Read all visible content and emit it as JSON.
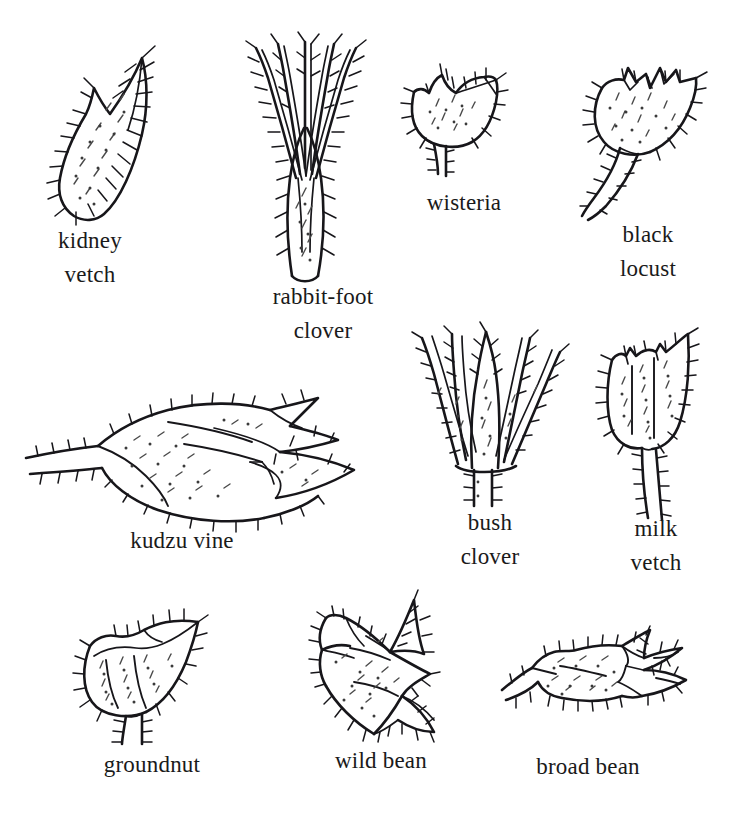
{
  "figure": {
    "background_color": "#ffffff",
    "ink_color": "#17161a",
    "caption_color": "#1a1a1a",
    "style": "pen-and-ink botanical line drawings, hairy calyx outlines with stipple shading"
  },
  "specimens": [
    {
      "id": "kidney-vetch",
      "label": "kidney\nvetch",
      "row": 1,
      "column": 1,
      "drawing": "narrow-pointed-hairy-calyx-with-side-notch"
    },
    {
      "id": "rabbit-foot-clover",
      "label": "rabbit-foot\nclover",
      "row": 1,
      "column": 2,
      "drawing": "tall-tube-with-five-long-slender-hairy-teeth"
    },
    {
      "id": "wisteria",
      "label": "wisteria",
      "row": 1,
      "column": 3,
      "drawing": "small-cup-calyx-with-short-teeth-and-stalk"
    },
    {
      "id": "black-locust",
      "label": "black\nlocust",
      "row": 1,
      "column": 4,
      "drawing": "rounded-cup-with-sawtooth-rim-and-thick-hairy-stalk"
    },
    {
      "id": "kudzu-vine",
      "label": "kudzu vine",
      "row": 2,
      "column": 1,
      "drawing": "sideways-calyx-with-long-pointed-lobes-and-left-stalk"
    },
    {
      "id": "bush-clover",
      "label": "bush\nclover",
      "row": 2,
      "column": 2,
      "drawing": "five-narrow-spreading-pointed-lobes-on-short-base"
    },
    {
      "id": "milk-vetch",
      "label": "milk\nvetch",
      "row": 2,
      "column": 3,
      "drawing": "broad-tubular-calyx-with-tiny-rim-teeth-and-long-stalk"
    },
    {
      "id": "groundnut",
      "label": "groundnut",
      "row": 3,
      "column": 1,
      "drawing": "broad-tilted-cup-with-pointed-upper-lobe-and-stalk"
    },
    {
      "id": "wild-bean",
      "label": "wild bean",
      "row": 3,
      "column": 2,
      "drawing": "angular-star-shaped-calyx-with-sharp-lobes"
    },
    {
      "id": "broad-bean",
      "label": "broad bean",
      "row": 3,
      "column": 3,
      "drawing": "horizontal-calyx-with-finger-like-lobes-to-the-right"
    }
  ]
}
